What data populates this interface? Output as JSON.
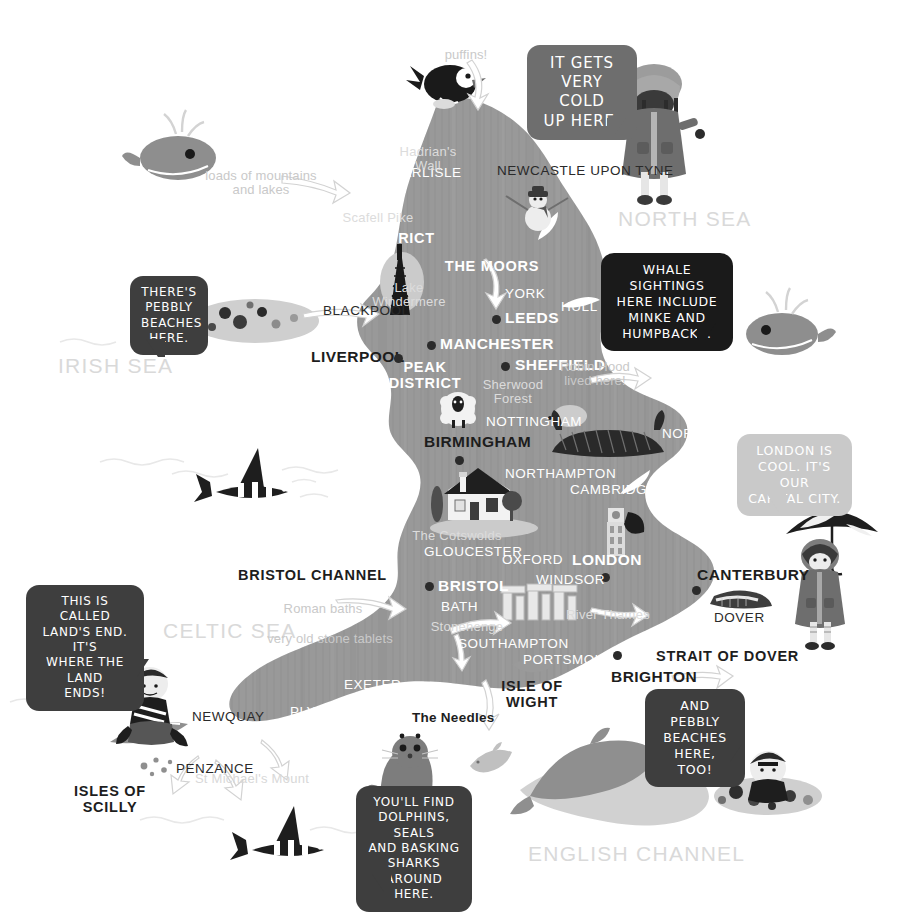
{
  "map": {
    "title": "Illustrated Map of England",
    "land_color": "#9a9a9a",
    "sea_color": "#ffffff"
  },
  "seas": [
    {
      "name": "north-sea",
      "label": "NORTH SEA",
      "x": 618,
      "y": 208
    },
    {
      "name": "irish-sea",
      "label": "IRISH SEA",
      "x": 58,
      "y": 355
    },
    {
      "name": "celtic-sea",
      "label": "CELTIC SEA",
      "x": 163,
      "y": 620
    },
    {
      "name": "english-channel",
      "label": "ENGLISH CHANNEL",
      "x": 528,
      "y": 843
    }
  ],
  "cities": [
    {
      "name": "carlisle",
      "label": "CARLISLE",
      "x": 392,
      "y": 166,
      "style": "city-min",
      "dot": null
    },
    {
      "name": "newcastle-upon-tyne",
      "label": "NEWCASTLE UPON TYNE",
      "x": 497,
      "y": 164,
      "style": "city-min-dark",
      "dot": null
    },
    {
      "name": "blackpool",
      "label": "BLACKPOOL",
      "x": 323,
      "y": 304,
      "style": "city-min-dark",
      "dot": null
    },
    {
      "name": "york",
      "label": "YORK",
      "x": 505,
      "y": 287,
      "style": "city-min",
      "dot": null
    },
    {
      "name": "hull",
      "label": "HULL",
      "x": 561,
      "y": 300,
      "style": "city-min",
      "dot": null
    },
    {
      "name": "leeds",
      "label": "LEEDS",
      "x": 505,
      "y": 310,
      "style": "city-major-white",
      "dot": {
        "x": 492,
        "y": 315
      }
    },
    {
      "name": "manchester",
      "label": "MANCHESTER",
      "x": 440,
      "y": 336,
      "style": "city-major-white",
      "dot": {
        "x": 427,
        "y": 341
      }
    },
    {
      "name": "liverpool",
      "label": "LIVERPOOL",
      "x": 311,
      "y": 349,
      "style": "city-major",
      "dot": {
        "x": 394,
        "y": 354
      }
    },
    {
      "name": "sheffield",
      "label": "SHEFFIELD",
      "x": 515,
      "y": 357,
      "style": "city-major-white",
      "dot": {
        "x": 501,
        "y": 362
      }
    },
    {
      "name": "nottingham",
      "label": "NOTTINGHAM",
      "x": 486,
      "y": 415,
      "style": "city-min",
      "dot": null
    },
    {
      "name": "birmingham",
      "label": "BIRMINGHAM",
      "x": 424,
      "y": 434,
      "style": "city-major",
      "dot": {
        "x": 455,
        "y": 456
      }
    },
    {
      "name": "norwich",
      "label": "NORWICH",
      "x": 662,
      "y": 427,
      "style": "city-min",
      "dot": null
    },
    {
      "name": "northampton",
      "label": "NORTHAMPTON",
      "x": 505,
      "y": 467,
      "style": "city-min",
      "dot": null
    },
    {
      "name": "cambridge",
      "label": "CAMBRIDGE",
      "x": 570,
      "y": 483,
      "style": "city-min",
      "dot": null
    },
    {
      "name": "ipswich",
      "label": "IPSWICH",
      "x": 657,
      "y": 499,
      "style": "city-min",
      "dot": null
    },
    {
      "name": "gloucester",
      "label": "GLOUCESTER",
      "x": 424,
      "y": 545,
      "style": "city-min",
      "dot": null
    },
    {
      "name": "oxford",
      "label": "OXFORD",
      "x": 502,
      "y": 553,
      "style": "city-min",
      "dot": null
    },
    {
      "name": "london",
      "label": "LONDON",
      "x": 572,
      "y": 552,
      "style": "city-major-white",
      "dot": {
        "x": 601,
        "y": 573
      }
    },
    {
      "name": "windsor",
      "label": "WINDSOR",
      "x": 536,
      "y": 573,
      "style": "city-min",
      "dot": null
    },
    {
      "name": "bristol",
      "label": "BRISTOL",
      "x": 438,
      "y": 578,
      "style": "city-major-white",
      "dot": {
        "x": 425,
        "y": 582
      }
    },
    {
      "name": "canterbury",
      "label": "CANTERBURY",
      "x": 697,
      "y": 567,
      "style": "city-major",
      "dot": {
        "x": 692,
        "y": 586
      }
    },
    {
      "name": "bath",
      "label": "BATH",
      "x": 441,
      "y": 600,
      "style": "city-min",
      "dot": null
    },
    {
      "name": "dover",
      "label": "DOVER",
      "x": 714,
      "y": 611,
      "style": "city-min-dark",
      "dot": null
    },
    {
      "name": "southampton",
      "label": "SOUTHAMPTON",
      "x": 458,
      "y": 637,
      "style": "city-min",
      "dot": null
    },
    {
      "name": "portsmouth",
      "label": "PORTSMOUTH",
      "x": 523,
      "y": 653,
      "style": "city-min",
      "dot": null
    },
    {
      "name": "brighton",
      "label": "BRIGHTON",
      "x": 611,
      "y": 669,
      "style": "city-major",
      "dot": {
        "x": 613,
        "y": 651
      }
    },
    {
      "name": "exeter",
      "label": "EXETER",
      "x": 344,
      "y": 678,
      "style": "city-min",
      "dot": null
    },
    {
      "name": "newquay",
      "label": "NEWQUAY",
      "x": 192,
      "y": 710,
      "style": "city-min-dark",
      "dot": null
    },
    {
      "name": "plymouth",
      "label": "PLYMOUTH",
      "x": 290,
      "y": 705,
      "style": "city-min",
      "dot": null
    },
    {
      "name": "penzance",
      "label": "PENZANCE",
      "x": 176,
      "y": 762,
      "style": "city-min-dark",
      "dot": null
    }
  ],
  "regions": [
    {
      "name": "lake-district",
      "label": "LAKE DISTRICT",
      "x": 375,
      "y": 231,
      "style": "region-white",
      "width": 120
    },
    {
      "name": "the-moors",
      "label": "THE MOORS",
      "x": 492,
      "y": 259,
      "style": "region-white",
      "width": 96
    },
    {
      "name": "peak-district",
      "label": "PEAK\nDISTRICT",
      "x": 425,
      "y": 360,
      "style": "region-white",
      "width": 78
    },
    {
      "name": "bristol-channel",
      "label": "BRISTOL CHANNEL",
      "x": 303,
      "y": 568,
      "style": "region-dark",
      "width": 130
    },
    {
      "name": "isle-of-wight",
      "label": "ISLE OF\nWIGHT",
      "x": 532,
      "y": 679,
      "style": "region-dark",
      "width": 76
    },
    {
      "name": "strait-of-dover",
      "label": "STRAIT OF DOVER",
      "x": 720,
      "y": 649,
      "style": "region-dark",
      "width": 128
    },
    {
      "name": "isles-of-scilly",
      "label": "ISLES OF\nSCILLY",
      "x": 110,
      "y": 784,
      "style": "region-dark",
      "width": 86
    }
  ],
  "features": [
    {
      "name": "hadrians-wall",
      "label": "Hadrian's\nWall",
      "x": 428,
      "y": 145,
      "width": 76,
      "style": "feature-on-land"
    },
    {
      "name": "scafell-pike",
      "label": "Scafell Pike",
      "x": 378,
      "y": 211,
      "width": 96,
      "style": "feature-on-land"
    },
    {
      "name": "lake-windermere",
      "label": "Lake\nWindermere",
      "x": 409,
      "y": 281,
      "width": 92,
      "style": "feature-on-land"
    },
    {
      "name": "sherwood-forest",
      "label": "Sherwood\nForest",
      "x": 513,
      "y": 378,
      "width": 80,
      "style": "feature-on-land"
    },
    {
      "name": "the-cotswolds",
      "label": "The Cotswolds",
      "x": 457,
      "y": 529,
      "width": 98,
      "style": "feature-on-land"
    },
    {
      "name": "stonehenge",
      "label": "Stonehenge",
      "x": 467,
      "y": 620,
      "width": 80,
      "style": "feature-on-land"
    },
    {
      "name": "river-thames",
      "label": "River Thames",
      "x": 608,
      "y": 608,
      "width": 90,
      "style": "feature-on-land"
    },
    {
      "name": "st-michaels-mount",
      "label": "St Michael's Mount",
      "x": 252,
      "y": 772,
      "width": 130,
      "style": "feature"
    },
    {
      "name": "the-needles",
      "label": "The Needles",
      "x": 453,
      "y": 711,
      "width": 82,
      "style": "needles-lbl"
    }
  ],
  "annotations": [
    {
      "name": "puffins-annotation",
      "label": "puffins!",
      "x": 466,
      "y": 48,
      "width": 60,
      "style": "annot"
    },
    {
      "name": "mountains-lakes-annotation",
      "label": "loads of mountains\nand lakes",
      "x": 261,
      "y": 169,
      "width": 146,
      "style": "annot"
    },
    {
      "name": "robin-hood-annotation",
      "label": "Robin Hood\nlived here!",
      "x": 595,
      "y": 360,
      "width": 92,
      "style": "annot"
    },
    {
      "name": "roman-baths-annotation",
      "label": "Roman baths",
      "x": 323,
      "y": 602,
      "width": 92,
      "style": "annot"
    },
    {
      "name": "stone-tablets-annotation",
      "label": "very old stone tablets",
      "x": 330,
      "y": 632,
      "width": 150,
      "style": "annot"
    }
  ],
  "bubbles": [
    {
      "name": "bubble-cold-up-here",
      "text": "IT GETS\nVERY COLD\nUP HERE.",
      "x": 527,
      "y": 45,
      "w": 110,
      "h": 75,
      "theme": "bubble-mid",
      "font": 15,
      "tail": {
        "x": 80,
        "y": 73,
        "dir": "down-right",
        "color": "#6e6e6e"
      }
    },
    {
      "name": "bubble-pebbly-beaches-here",
      "text": "THERE'S\nPEBBLY\nBEACHES\nHERE.",
      "x": 130,
      "y": 276,
      "w": 78,
      "h": 65,
      "theme": "bubble-dark",
      "font": 12,
      "tail": {
        "x": 16,
        "y": 63,
        "dir": "down-left",
        "color": "#3e3e3e"
      }
    },
    {
      "name": "bubble-whale-sightings",
      "text": "WHALE SIGHTINGS\nHERE INCLUDE\nMINKE AND\nHUMPBACKS.",
      "x": 601,
      "y": 253,
      "w": 132,
      "h": 72,
      "theme": "bubble-black",
      "font": 12.5,
      "tail": {
        "x": 96,
        "y": 70,
        "dir": "down-right",
        "color": "#1a1a1a"
      }
    },
    {
      "name": "bubble-london-capital",
      "text": "LONDON IS\nCOOL. IT'S OUR\nCAPITAL CITY.",
      "x": 737,
      "y": 434,
      "w": 115,
      "h": 62,
      "theme": "bubble-light",
      "font": 12.5,
      "tail": {
        "x": 30,
        "y": 60,
        "dir": "down-left",
        "color": "#c9c9c9"
      }
    },
    {
      "name": "bubble-lands-end",
      "text": "THIS IS CALLED\nLAND'S END. IT'S\nWHERE THE LAND\nENDS!",
      "x": 26,
      "y": 585,
      "w": 118,
      "h": 76,
      "theme": "bubble-dark",
      "font": 12,
      "tail": {
        "x": 104,
        "y": 74,
        "dir": "down-right",
        "color": "#3e3e3e"
      }
    },
    {
      "name": "bubble-pebbly-beaches-too",
      "text": "AND PEBBLY\nBEACHES\nHERE, TOO!",
      "x": 645,
      "y": 689,
      "w": 100,
      "h": 57,
      "theme": "bubble-dark",
      "font": 12.5,
      "tail": {
        "x": 78,
        "y": 55,
        "dir": "down-right",
        "color": "#3e3e3e"
      }
    },
    {
      "name": "bubble-dolphins-seals",
      "text": "YOU'LL FIND\nDOLPHINS, SEALS\nAND BASKING\nSHARKS AROUND\nHERE.",
      "x": 356,
      "y": 786,
      "w": 116,
      "h": 90,
      "theme": "bubble-dark",
      "font": 12,
      "tail": {
        "x": 16,
        "y": 88,
        "dir": "down-left",
        "color": "#3e3e3e"
      }
    }
  ],
  "illustrations": [
    {
      "name": "puffin-bird-illustration",
      "x": 426,
      "y": 60,
      "w": 56,
      "h": 50
    },
    {
      "name": "girl-in-parka-illustration",
      "x": 614,
      "y": 52,
      "w": 84,
      "h": 160
    },
    {
      "name": "snowman-illustration",
      "x": 516,
      "y": 188,
      "w": 48,
      "h": 48
    },
    {
      "name": "radio-tower-illustration",
      "x": 374,
      "y": 253,
      "w": 32,
      "h": 62
    },
    {
      "name": "whale-northwest-illustration",
      "x": 143,
      "y": 120,
      "w": 72,
      "h": 62
    },
    {
      "name": "whale-northeast-illustration",
      "x": 748,
      "y": 300,
      "w": 72,
      "h": 60
    },
    {
      "name": "sheep-illustration",
      "x": 440,
      "y": 392,
      "w": 38,
      "h": 38
    },
    {
      "name": "hedgehog-illustration",
      "x": 556,
      "y": 405,
      "w": 34,
      "h": 26
    },
    {
      "name": "longboat-illustration",
      "x": 552,
      "y": 420,
      "w": 110,
      "h": 38
    },
    {
      "name": "shark-fin-west-illustration",
      "x": 206,
      "y": 450,
      "w": 96,
      "h": 52
    },
    {
      "name": "cottage-illustration",
      "x": 432,
      "y": 470,
      "w": 92,
      "h": 68
    },
    {
      "name": "big-ben-illustration",
      "x": 603,
      "y": 500,
      "w": 36,
      "h": 58
    },
    {
      "name": "stonehenge-illustration",
      "x": 503,
      "y": 588,
      "w": 72,
      "h": 34
    },
    {
      "name": "white-cliffs-illustration",
      "x": 716,
      "y": 590,
      "w": 58,
      "h": 26
    },
    {
      "name": "girl-with-umbrella-illustration",
      "x": 786,
      "y": 500,
      "w": 98,
      "h": 146
    },
    {
      "name": "boy-surfer-illustration",
      "x": 110,
      "y": 668,
      "w": 88,
      "h": 100
    },
    {
      "name": "seal-illustration",
      "x": 368,
      "y": 730,
      "w": 66,
      "h": 86
    },
    {
      "name": "dolphin-small-illustration",
      "x": 470,
      "y": 742,
      "w": 56,
      "h": 32
    },
    {
      "name": "dolphin-large-illustration",
      "x": 520,
      "y": 742,
      "w": 180,
      "h": 78
    },
    {
      "name": "boy-on-rocks-illustration",
      "x": 712,
      "y": 724,
      "w": 108,
      "h": 88
    },
    {
      "name": "shark-fin-south-illustration",
      "x": 242,
      "y": 808,
      "w": 96,
      "h": 52
    }
  ]
}
